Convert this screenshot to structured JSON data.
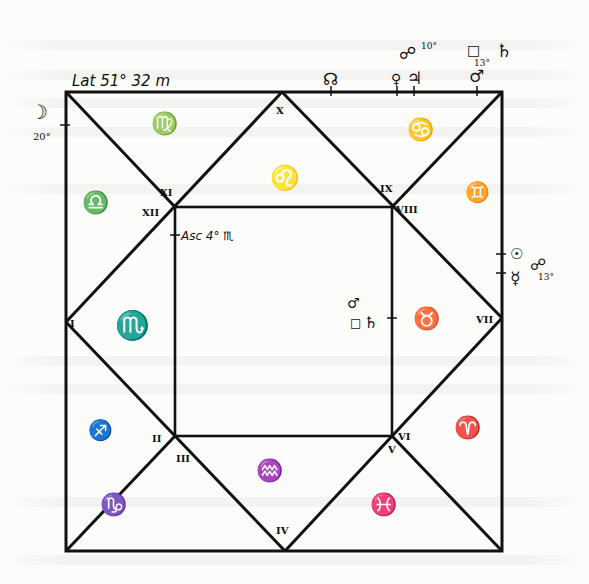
{
  "latitude_label": "Lat 51° 32 m",
  "houses": [
    {
      "numeral": "I",
      "sign": "♏",
      "sign_name": "Scorpio"
    },
    {
      "numeral": "II",
      "sign": "♐",
      "sign_name": "Sagittarius"
    },
    {
      "numeral": "III",
      "sign": "♑",
      "sign_name": "Capricorn"
    },
    {
      "numeral": "IV",
      "sign": "♒",
      "sign_name": "Aquarius"
    },
    {
      "numeral": "V",
      "sign": "♓",
      "sign_name": "Pisces"
    },
    {
      "numeral": "VI",
      "sign": "♈",
      "sign_name": "Aries"
    },
    {
      "numeral": "VII",
      "sign": "♉",
      "sign_name": "Taurus"
    },
    {
      "numeral": "VIII",
      "sign": "♊",
      "sign_name": "Gemini"
    },
    {
      "numeral": "IX",
      "sign": "♋",
      "sign_name": "Cancer"
    },
    {
      "numeral": "X",
      "sign": "♌",
      "sign_name": "Leo"
    },
    {
      "numeral": "XI",
      "sign": "♍",
      "sign_name": "Virgo"
    },
    {
      "numeral": "XII",
      "sign": "♎",
      "sign_name": "Libra"
    }
  ],
  "ascendant_label": "Asc 4° ♏",
  "top_edge": {
    "node": "☊",
    "venus": "♀",
    "jupiter": "♃",
    "mars": "♂",
    "aspect_opposition": "☍",
    "aspect_opposition_deg": "10°",
    "aspect_square": "□",
    "aspect_square_deg": "13°",
    "saturn": "♄"
  },
  "left_edge": {
    "moon": "☽",
    "moon_deg": "20°"
  },
  "right_edge": {
    "sun": "☉",
    "mercury": "☿",
    "aspect_opposition": "☍",
    "aspect_deg": "13°"
  },
  "inner_right": {
    "mars": "♂",
    "aspect_square": "□",
    "saturn": "♄"
  },
  "colors": {
    "ink": "#111111",
    "paper": "#fcfcfa"
  }
}
